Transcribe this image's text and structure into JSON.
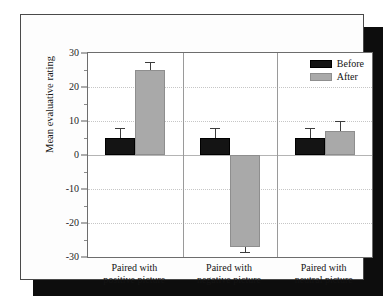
{
  "chart_data": {
    "type": "bar",
    "title": "",
    "xlabel": "",
    "ylabel": "Mean evaluative rating",
    "ylim": [
      -30,
      30
    ],
    "ytick_step": 10,
    "yticks": [
      30,
      20,
      10,
      0,
      -10,
      -20,
      -30
    ],
    "ytick_labels": [
      "30",
      "20",
      "10",
      "0",
      "-10",
      "-20",
      "-30"
    ],
    "grid": true,
    "legend_position": "top-right",
    "categories": [
      "Paired with\npositive picture",
      "Paired with\nnegative picture",
      "Paired with\nneutral picture"
    ],
    "category_lines": [
      [
        "Paired with",
        "positive picture"
      ],
      [
        "Paired with",
        "negative picture"
      ],
      [
        "Paired with",
        "neutral picture"
      ]
    ],
    "series": [
      {
        "name": "Before",
        "color": "#141414",
        "values": [
          5,
          5,
          5
        ],
        "errors": [
          3,
          3,
          3
        ]
      },
      {
        "name": "After",
        "color": "#a9a9a9",
        "values": [
          25,
          -27,
          7
        ],
        "errors": [
          2.5,
          1.5,
          3
        ]
      }
    ]
  },
  "legend": {
    "items": [
      {
        "label": "Before",
        "swatch": "before"
      },
      {
        "label": "After",
        "swatch": "after"
      }
    ]
  },
  "axis": {
    "y_title": "Mean evaluative rating"
  }
}
